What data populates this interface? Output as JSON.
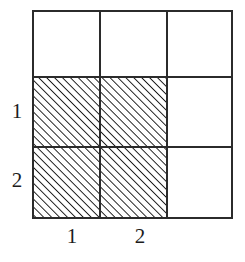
{
  "figure": {
    "title": "",
    "colors": {
      "background": "#ffffff",
      "grid_line": "#2b2b2b",
      "hatch_line": "#1a1a1a",
      "label_text": "#1c1c1c"
    },
    "grid": {
      "columns": 3,
      "rows": 3,
      "left": 33,
      "top": 11,
      "right": 232,
      "bottom": 218,
      "x_dividers": [
        100,
        167
      ],
      "y_dividers": [
        77,
        147
      ],
      "outer_line_width": 2.4,
      "inner_line_width": 1.8
    },
    "hatch": {
      "direction": "up-right",
      "angle_degrees": 45,
      "spacing_px": 5.6,
      "line_width_px": 2.1,
      "region": {
        "x": 33,
        "y": 77,
        "width": 134,
        "height": 141,
        "cells": [
          "r2c1",
          "r2c2",
          "r3c1",
          "r3c2"
        ]
      }
    },
    "row_labels": [
      {
        "text": "1",
        "row_index": 2
      },
      {
        "text": "2",
        "row_index": 3
      }
    ],
    "column_labels": [
      {
        "text": "1",
        "column_index": 1
      },
      {
        "text": "2",
        "column_index": 2
      }
    ]
  }
}
